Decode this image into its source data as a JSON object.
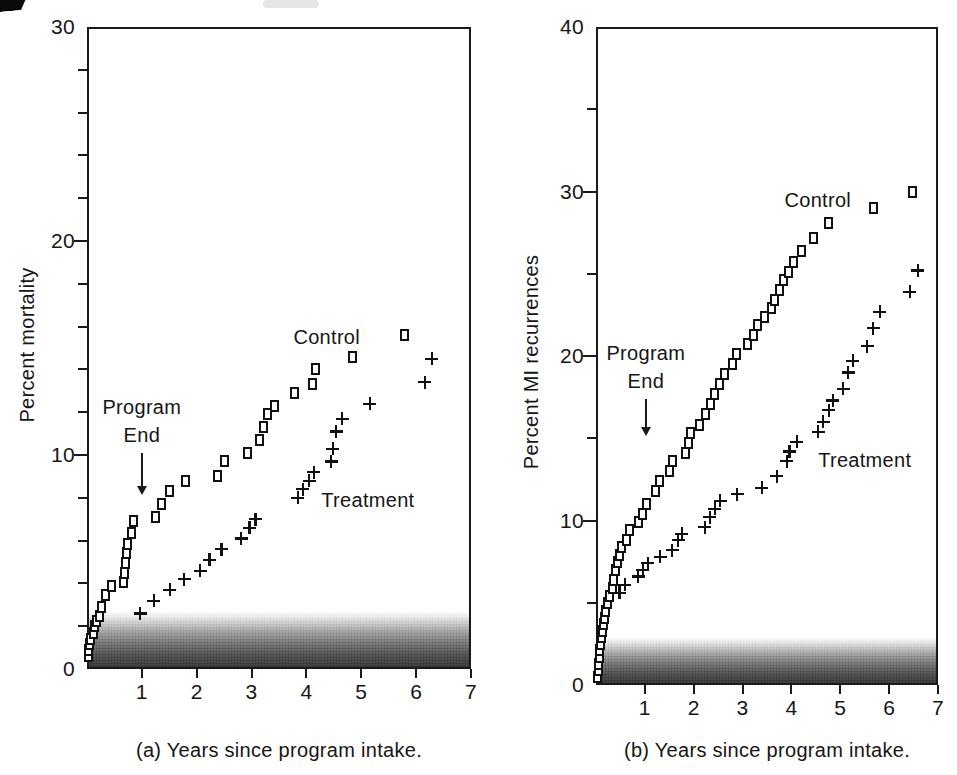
{
  "figure": {
    "ink_color": "#1a1a1a",
    "background": "#ffffff"
  },
  "chart_data": [
    {
      "type": "scatter",
      "panel": "a",
      "caption": "(a) Years since program intake.",
      "ylabel": "Percent mortality",
      "xlim": [
        0,
        7
      ],
      "ylim": [
        0,
        30
      ],
      "x_ticks": [
        1,
        2,
        3,
        4,
        5,
        6,
        7
      ],
      "y_ticks": [
        0,
        10,
        20,
        30
      ],
      "y_minor_step": 2,
      "grid": false,
      "shade_band": {
        "from_y": 0,
        "to_y": 2.7
      },
      "annotations": {
        "program_end": {
          "line1": "Program",
          "line2": "End",
          "arrow_x": 1.0,
          "arrow_from_y": 10.1,
          "arrow_to_y": 8.2
        },
        "series_labels": [
          {
            "text": "Control",
            "x": 4.37,
            "y": 15.5
          },
          {
            "text": "Treatment",
            "x": 5.12,
            "y": 7.9
          }
        ]
      },
      "series": [
        {
          "name": "Control",
          "marker": "square",
          "points": [
            [
              0.02,
              0.6
            ],
            [
              0.03,
              0.9
            ],
            [
              0.05,
              1.15
            ],
            [
              0.06,
              1.4
            ],
            [
              0.12,
              1.7
            ],
            [
              0.14,
              2.0
            ],
            [
              0.18,
              2.25
            ],
            [
              0.23,
              2.5
            ],
            [
              0.27,
              2.9
            ],
            [
              0.33,
              3.45
            ],
            [
              0.45,
              3.9
            ],
            [
              0.66,
              4.05
            ],
            [
              0.68,
              4.5
            ],
            [
              0.7,
              4.95
            ],
            [
              0.72,
              5.4
            ],
            [
              0.74,
              5.85
            ],
            [
              0.82,
              6.35
            ],
            [
              0.85,
              6.9
            ],
            [
              1.24,
              7.1
            ],
            [
              1.35,
              7.7
            ],
            [
              1.51,
              8.3
            ],
            [
              1.79,
              8.8
            ],
            [
              2.38,
              9.0
            ],
            [
              2.5,
              9.7
            ],
            [
              2.92,
              10.1
            ],
            [
              3.15,
              10.7
            ],
            [
              3.22,
              11.3
            ],
            [
              3.29,
              11.9
            ],
            [
              3.42,
              12.3
            ],
            [
              3.78,
              12.9
            ],
            [
              4.11,
              13.3
            ],
            [
              4.16,
              14.0
            ],
            [
              4.84,
              14.6
            ],
            [
              5.78,
              15.6
            ]
          ]
        },
        {
          "name": "Treatment",
          "marker": "plus",
          "points": [
            [
              0.97,
              2.6
            ],
            [
              1.22,
              3.2
            ],
            [
              1.51,
              3.7
            ],
            [
              1.77,
              4.2
            ],
            [
              2.06,
              4.6
            ],
            [
              2.23,
              5.1
            ],
            [
              2.45,
              5.6
            ],
            [
              2.81,
              6.1
            ],
            [
              2.96,
              6.6
            ],
            [
              3.07,
              7.0
            ],
            [
              3.84,
              8.0
            ],
            [
              3.93,
              8.4
            ],
            [
              4.05,
              8.8
            ],
            [
              4.13,
              9.2
            ],
            [
              4.45,
              9.7
            ],
            [
              4.48,
              10.3
            ],
            [
              4.54,
              11.1
            ],
            [
              4.65,
              11.7
            ],
            [
              5.15,
              12.4
            ],
            [
              6.16,
              13.4
            ],
            [
              6.28,
              14.5
            ]
          ]
        }
      ]
    },
    {
      "type": "scatter",
      "panel": "b",
      "caption": "(b) Years since program intake.",
      "ylabel": "Percent MI recurrences",
      "xlim": [
        0,
        7
      ],
      "ylim": [
        0,
        40
      ],
      "x_ticks": [
        1,
        2,
        3,
        4,
        5,
        6,
        7
      ],
      "y_ticks": [
        0,
        10,
        20,
        30,
        40
      ],
      "y_minor_step": 5,
      "grid": false,
      "shade_band": {
        "from_y": 0,
        "to_y": 2.9
      },
      "annotations": {
        "program_end": {
          "line1": "Program",
          "line2": "End",
          "arrow_x": 1.02,
          "arrow_from_y": 17.4,
          "arrow_to_y": 15.2
        },
        "series_labels": [
          {
            "text": "Control",
            "x": 4.54,
            "y": 29.5
          },
          {
            "text": "Treatment",
            "x": 5.5,
            "y": 13.7
          }
        ]
      },
      "series": [
        {
          "name": "Control",
          "marker": "square",
          "points": [
            [
              0.04,
              0.5
            ],
            [
              0.05,
              0.9
            ],
            [
              0.06,
              1.3
            ],
            [
              0.07,
              1.7
            ],
            [
              0.08,
              2.1
            ],
            [
              0.1,
              2.5
            ],
            [
              0.11,
              2.9
            ],
            [
              0.13,
              3.3
            ],
            [
              0.15,
              3.7
            ],
            [
              0.17,
              4.1
            ],
            [
              0.2,
              4.5
            ],
            [
              0.24,
              5.0
            ],
            [
              0.28,
              5.4
            ],
            [
              0.33,
              5.9
            ],
            [
              0.36,
              6.4
            ],
            [
              0.4,
              7.0
            ],
            [
              0.43,
              7.5
            ],
            [
              0.48,
              7.9
            ],
            [
              0.52,
              8.4
            ],
            [
              0.62,
              8.8
            ],
            [
              0.69,
              9.4
            ],
            [
              0.88,
              9.9
            ],
            [
              0.96,
              10.4
            ],
            [
              1.04,
              11.0
            ],
            [
              1.22,
              11.8
            ],
            [
              1.3,
              12.4
            ],
            [
              1.5,
              13.0
            ],
            [
              1.57,
              13.6
            ],
            [
              1.83,
              14.1
            ],
            [
              1.89,
              14.7
            ],
            [
              1.94,
              15.3
            ],
            [
              2.12,
              15.8
            ],
            [
              2.25,
              16.5
            ],
            [
              2.34,
              17.1
            ],
            [
              2.43,
              17.7
            ],
            [
              2.52,
              18.3
            ],
            [
              2.62,
              18.9
            ],
            [
              2.8,
              19.5
            ],
            [
              2.88,
              20.1
            ],
            [
              3.1,
              20.7
            ],
            [
              3.22,
              21.3
            ],
            [
              3.3,
              21.9
            ],
            [
              3.44,
              22.4
            ],
            [
              3.6,
              22.9
            ],
            [
              3.66,
              23.4
            ],
            [
              3.76,
              24.0
            ],
            [
              3.84,
              24.6
            ],
            [
              3.94,
              25.1
            ],
            [
              4.04,
              25.7
            ],
            [
              4.2,
              26.4
            ],
            [
              4.45,
              27.2
            ],
            [
              4.76,
              28.1
            ],
            [
              5.67,
              29.0
            ],
            [
              6.48,
              30.0
            ]
          ]
        },
        {
          "name": "Treatment",
          "marker": "plus",
          "points": [
            [
              0.48,
              5.6
            ],
            [
              0.59,
              6.1
            ],
            [
              0.86,
              6.6
            ],
            [
              0.96,
              7.0
            ],
            [
              1.06,
              7.4
            ],
            [
              1.31,
              7.8
            ],
            [
              1.56,
              8.2
            ],
            [
              1.68,
              8.8
            ],
            [
              1.76,
              9.2
            ],
            [
              2.23,
              9.6
            ],
            [
              2.33,
              10.2
            ],
            [
              2.43,
              10.7
            ],
            [
              2.54,
              11.2
            ],
            [
              2.89,
              11.6
            ],
            [
              3.39,
              12.0
            ],
            [
              3.7,
              12.7
            ],
            [
              3.9,
              13.6
            ],
            [
              3.96,
              14.2
            ],
            [
              4.11,
              14.8
            ],
            [
              4.55,
              15.4
            ],
            [
              4.65,
              16.0
            ],
            [
              4.76,
              16.7
            ],
            [
              4.85,
              17.3
            ],
            [
              5.06,
              18.0
            ],
            [
              5.16,
              19.0
            ],
            [
              5.25,
              19.7
            ],
            [
              5.55,
              20.6
            ],
            [
              5.67,
              21.7
            ],
            [
              5.81,
              22.7
            ],
            [
              6.42,
              23.9
            ],
            [
              6.59,
              25.2
            ]
          ]
        }
      ]
    }
  ]
}
